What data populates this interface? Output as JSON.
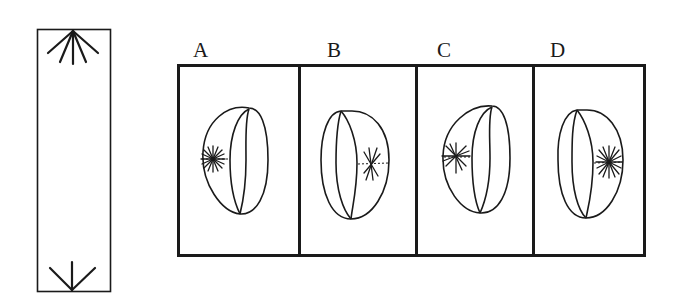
{
  "figure": {
    "type": "spatial-reasoning-puzzle",
    "stem": {
      "description": "tall strip with fan of lines at top and converging lines at bottom",
      "top_pattern": "fan-burst",
      "bottom_pattern": "arrow-converge"
    },
    "options": [
      {
        "label": "A",
        "ring_opening": "right",
        "star_side": "left",
        "star_style": "dense-burst"
      },
      {
        "label": "B",
        "ring_opening": "left",
        "star_side": "right",
        "star_style": "sparse-cross"
      },
      {
        "label": "C",
        "ring_opening": "right",
        "star_side": "left",
        "star_style": "burst"
      },
      {
        "label": "D",
        "ring_opening": "left",
        "star_side": "right",
        "star_style": "dense-burst"
      }
    ],
    "colors": {
      "ink": "#1a1a1a",
      "background": "#ffffff"
    }
  }
}
